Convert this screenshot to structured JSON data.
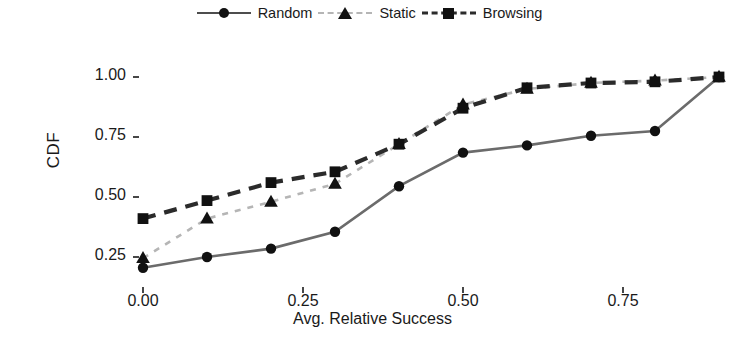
{
  "chart_data": {
    "type": "line",
    "title": "",
    "xlabel": "Avg. Relative Success",
    "ylabel": "CDF",
    "xlim": [
      -0.03,
      0.93
    ],
    "ylim": [
      0.16,
      1.04
    ],
    "xticks": [
      "0.00",
      "0.25",
      "0.50",
      "0.75"
    ],
    "xtick_values": [
      0.0,
      0.25,
      0.5,
      0.75
    ],
    "yticks": [
      "0.25",
      "0.50",
      "0.75",
      "1.00"
    ],
    "ytick_values": [
      0.25,
      0.5,
      0.75,
      1.0
    ],
    "grid": false,
    "legend_position": "top-center",
    "x": [
      0.0,
      0.1,
      0.2,
      0.3,
      0.4,
      0.5,
      0.6,
      0.7,
      0.8,
      0.9
    ],
    "series": [
      {
        "name": "Random",
        "marker": "circle",
        "linestyle": "solid",
        "color": "#6b6b6b",
        "values": [
          0.205,
          0.25,
          0.285,
          0.355,
          0.545,
          0.685,
          0.715,
          0.755,
          0.775,
          1.0
        ]
      },
      {
        "name": "Static",
        "marker": "triangle",
        "linestyle": "dotted",
        "color": "#b5b5b5",
        "values": [
          0.245,
          0.41,
          0.48,
          0.555,
          0.72,
          0.885,
          0.95,
          0.975,
          0.985,
          1.0
        ]
      },
      {
        "name": "Browsing",
        "marker": "square",
        "linestyle": "dashed",
        "color": "#2b2b2b",
        "values": [
          0.41,
          0.485,
          0.56,
          0.605,
          0.72,
          0.87,
          0.955,
          0.975,
          0.98,
          1.0
        ]
      }
    ]
  },
  "legend": {
    "items": [
      {
        "label": "Random",
        "key": "solid-circle"
      },
      {
        "label": "Static",
        "key": "dotted-triangle"
      },
      {
        "label": "Browsing",
        "key": "dashed-square"
      }
    ]
  },
  "axes": {
    "x_title": "Avg. Relative Success",
    "y_title": "CDF"
  }
}
